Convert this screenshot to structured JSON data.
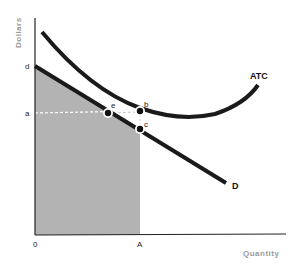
{
  "diagram": {
    "type": "economics-cost-demand",
    "axes": {
      "y_title": "Dollars",
      "x_title": "Quantity",
      "origin_label": "0"
    },
    "labels": {
      "d": "d",
      "a": "a",
      "A": "A",
      "e": "e",
      "b": "b",
      "c": "c"
    },
    "curves": {
      "atc": "ATC",
      "demand": "D"
    },
    "colors": {
      "curve": "#1a1a1a",
      "shade": "#b3b3b3",
      "axis_title": "#9a9a9a",
      "dashed": "#ffffff"
    }
  }
}
